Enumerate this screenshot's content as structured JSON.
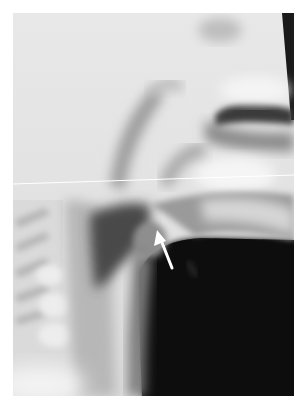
{
  "image": {
    "kind": "lateral neck radiograph",
    "annotation": {
      "type": "arrow",
      "color": "#ffffff",
      "tip": [
        158,
        233
      ],
      "tail": [
        172,
        268
      ],
      "direction": "up-left"
    },
    "scan_line": {
      "color": "#ffffff",
      "y_left": 184,
      "y_right": 175
    },
    "colors": {
      "background": "#ffffff",
      "bright_tissue": "#ececec",
      "soft_tissue": "#9a9a9a",
      "airway_dark": "#0a0a0a"
    }
  }
}
